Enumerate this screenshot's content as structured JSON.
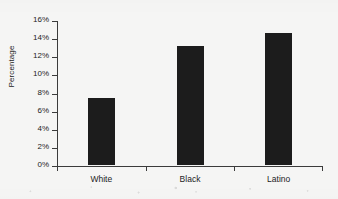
{
  "chart_data": {
    "type": "bar",
    "title": "",
    "xlabel": "",
    "ylabel": "Percentage",
    "categories": [
      "White",
      "Black",
      "Latino"
    ],
    "values": [
      7.4,
      13.1,
      14.6
    ],
    "ylim": [
      0,
      16
    ],
    "ytick_values": [
      0,
      2,
      4,
      6,
      8,
      10,
      12,
      14,
      16
    ],
    "ytick_labels": [
      "0%",
      "2%",
      "4%",
      "6%",
      "8%",
      "10%",
      "12%",
      "14%",
      "16%"
    ],
    "grid": false,
    "legend": false,
    "bar_color": "#1c1c1c",
    "axis_color": "#3b3b3b",
    "background_color": "#f5f5f4"
  }
}
